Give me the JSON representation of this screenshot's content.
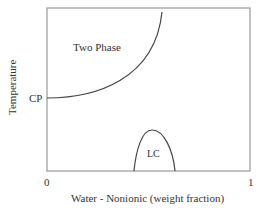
{
  "diagram": {
    "type": "phase-diagram",
    "y_axis_label": "Temperature",
    "x_axis_label": "Water - Nonionic (weight fraction)",
    "x_tick_min": "0",
    "x_tick_max": "1",
    "y_marker": "CP",
    "regions": {
      "two_phase": "Two Phase",
      "liquid_crystal": "LC"
    },
    "colors": {
      "frame": "#999999",
      "curve": "#444444",
      "text": "#333333"
    }
  }
}
